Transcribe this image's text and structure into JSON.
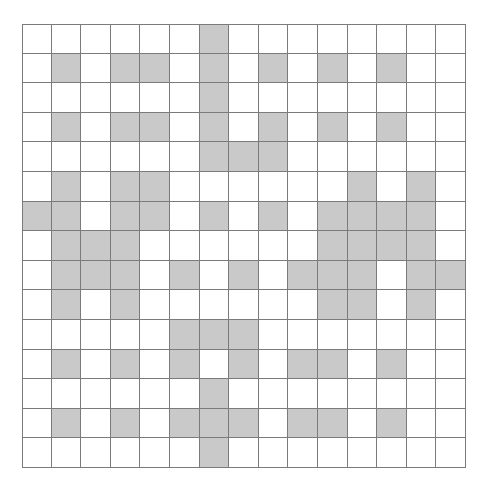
{
  "page": {
    "width": 491,
    "height": 494,
    "background_color": "#ffffff"
  },
  "grid": {
    "rows": 15,
    "cols": 15,
    "origin_x": 22,
    "origin_y": 24,
    "cell_size": 29.6,
    "line_color": "#7b7b7b",
    "filled_color": "#c9c9c9",
    "empty_color": "#ffffff",
    "filled_count": 120,
    "matrix": [
      [
        0,
        0,
        0,
        0,
        0,
        0,
        1,
        0,
        0,
        0,
        0,
        0,
        0,
        0,
        0
      ],
      [
        0,
        1,
        0,
        1,
        1,
        0,
        1,
        0,
        1,
        0,
        1,
        0,
        1,
        0,
        0
      ],
      [
        0,
        0,
        0,
        0,
        0,
        0,
        1,
        0,
        0,
        0,
        0,
        0,
        0,
        0,
        0
      ],
      [
        0,
        1,
        0,
        1,
        1,
        0,
        1,
        0,
        1,
        0,
        1,
        0,
        1,
        0,
        0
      ],
      [
        0,
        0,
        0,
        0,
        0,
        0,
        1,
        1,
        1,
        0,
        0,
        0,
        0,
        0,
        0
      ],
      [
        0,
        1,
        0,
        1,
        1,
        0,
        0,
        0,
        0,
        0,
        0,
        1,
        0,
        1,
        0
      ],
      [
        1,
        1,
        0,
        1,
        1,
        0,
        1,
        0,
        1,
        0,
        1,
        1,
        1,
        1,
        0
      ],
      [
        0,
        1,
        1,
        1,
        0,
        0,
        0,
        0,
        0,
        0,
        1,
        1,
        1,
        1,
        0
      ],
      [
        0,
        1,
        1,
        1,
        0,
        1,
        0,
        1,
        0,
        1,
        1,
        1,
        0,
        1,
        1
      ],
      [
        0,
        1,
        0,
        1,
        0,
        0,
        0,
        0,
        0,
        0,
        1,
        1,
        0,
        1,
        0
      ],
      [
        0,
        0,
        0,
        0,
        0,
        1,
        1,
        1,
        0,
        0,
        0,
        0,
        0,
        0,
        0
      ],
      [
        0,
        1,
        0,
        1,
        0,
        1,
        0,
        1,
        0,
        1,
        1,
        0,
        1,
        0,
        0
      ],
      [
        0,
        0,
        0,
        0,
        0,
        0,
        1,
        0,
        0,
        0,
        0,
        0,
        0,
        0,
        0
      ],
      [
        0,
        1,
        0,
        1,
        0,
        1,
        1,
        1,
        0,
        1,
        1,
        0,
        1,
        0,
        0
      ],
      [
        0,
        0,
        0,
        0,
        0,
        0,
        1,
        0,
        0,
        0,
        0,
        0,
        0,
        0,
        0
      ]
    ]
  }
}
